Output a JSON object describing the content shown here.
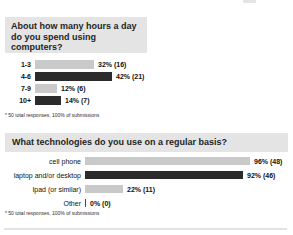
{
  "colors": {
    "bar_light": "#c9c9c9",
    "bar_dark": "#2b2b2b",
    "title_bg": "#e4e4e4"
  },
  "chart_data": [
    {
      "type": "bar",
      "orientation": "horizontal",
      "title": "About how many hours a day do you spend using computers?",
      "categories": [
        "1-3",
        "4-6",
        "7-9",
        "10+"
      ],
      "values_percent": [
        32,
        42,
        12,
        14
      ],
      "counts": [
        16,
        21,
        6,
        7
      ],
      "labels": [
        "32% (16)",
        "42% (21)",
        "12% (6)",
        "14% (7)"
      ],
      "xlim": [
        0,
        100
      ],
      "footnote": "* 50 total responses, 100% of submissions"
    },
    {
      "type": "bar",
      "orientation": "horizontal",
      "title": "What technologies do you use on a regular basis?",
      "categories": [
        "cell phone",
        "laptop and/or desktop",
        "Ipad (or similar)",
        "Other"
      ],
      "values_percent": [
        96,
        92,
        22,
        0
      ],
      "counts": [
        48,
        46,
        11,
        0
      ],
      "labels": [
        "96% (48)",
        "92% (46)",
        "22% (11)",
        "0% (0)"
      ],
      "xlim": [
        0,
        100
      ],
      "footnote": "* 50 total responses, 100% of submissions"
    }
  ]
}
